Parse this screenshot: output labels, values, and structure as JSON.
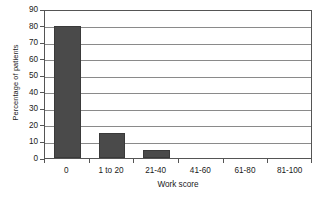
{
  "chart_data": {
    "type": "bar",
    "title": "",
    "subtitle": "",
    "xlabel": "Work score",
    "ylabel": "Percentage of patients",
    "categories": [
      "0",
      "1 to 20",
      "21-40",
      "41-60",
      "61-80",
      "81-100"
    ],
    "values": [
      80,
      15,
      5,
      0,
      0,
      0
    ],
    "ylim": [
      0,
      90
    ],
    "ytick_step": 10,
    "yticks": [
      "0",
      "10",
      "20",
      "30",
      "40",
      "50",
      "60",
      "70",
      "80",
      "90"
    ],
    "grid": "horizontal",
    "legend": "none",
    "bar_color": "#4a4a4a",
    "axis_color": "#555555",
    "gridline_color": "#8a8a8a",
    "background_color": "#ffffff"
  },
  "figure": {
    "y_axis_title": "Percentage of patients",
    "x_axis_title": "Work score"
  },
  "caption": {
    "cropped_line": ""
  }
}
